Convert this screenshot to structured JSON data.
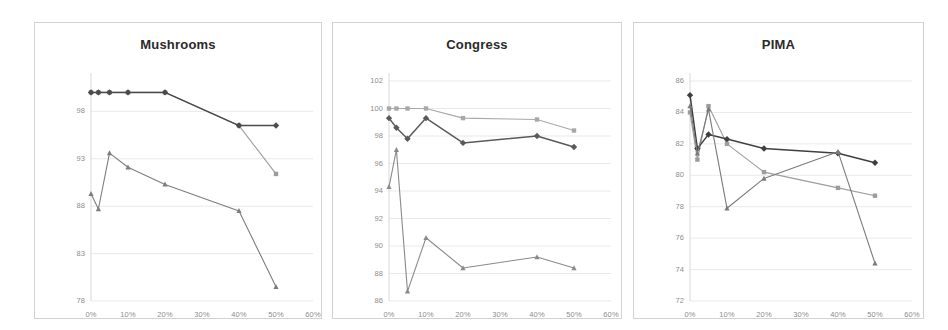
{
  "figure": {
    "background": "#ffffff",
    "panel_border_color": "#d2d2d2"
  },
  "panels": [
    {
      "id": "mushrooms",
      "title": "Mushrooms"
    },
    {
      "id": "congress",
      "title": "Congress"
    },
    {
      "id": "pima",
      "title": "PIMA"
    }
  ],
  "chart_data": [
    {
      "type": "line",
      "title": "Mushrooms",
      "xlabel": "",
      "ylabel": "",
      "xlim": [
        0,
        60
      ],
      "ylim": [
        78,
        101.2
      ],
      "yticks": [
        78,
        83,
        88,
        93,
        98
      ],
      "xticks": [
        0,
        10,
        20,
        30,
        40,
        50,
        60
      ],
      "xticklabels": [
        "0%",
        "10%",
        "20%",
        "30%",
        "40%",
        "50%",
        "60%"
      ],
      "grid": true,
      "legend": "none",
      "series": [
        {
          "name": "series-1",
          "color": "#9b9b9b",
          "marker": "square",
          "x": [
            0,
            2,
            5,
            10,
            20,
            40,
            50
          ],
          "y": [
            100.0,
            100.0,
            100.0,
            100.0,
            100.0,
            96.5,
            91.4
          ]
        },
        {
          "name": "series-2",
          "color": "#4a4a4a",
          "marker": "diamond",
          "x": [
            0,
            2,
            5,
            10,
            20,
            40,
            50
          ],
          "y": [
            100.0,
            100.0,
            100.0,
            100.0,
            100.0,
            96.5,
            96.5
          ]
        },
        {
          "name": "series-3",
          "color": "#7d7d7d",
          "marker": "triangle",
          "x": [
            0,
            2,
            5,
            10,
            20,
            40,
            50
          ],
          "y": [
            89.3,
            87.7,
            93.6,
            92.1,
            90.3,
            87.5,
            79.5
          ]
        }
      ]
    },
    {
      "type": "line",
      "title": "Congress",
      "xlabel": "",
      "ylabel": "",
      "xlim": [
        0,
        60
      ],
      "ylim": [
        86,
        102
      ],
      "yticks": [
        86,
        88,
        90,
        92,
        94,
        96,
        98,
        100,
        102
      ],
      "xticks": [
        0,
        10,
        20,
        30,
        40,
        50,
        60
      ],
      "xticklabels": [
        "0%",
        "10%",
        "20%",
        "30%",
        "40%",
        "50%",
        "60%"
      ],
      "grid": true,
      "legend": "none",
      "series": [
        {
          "name": "series-1",
          "color": "#a8a8a8",
          "marker": "square",
          "x": [
            0,
            2,
            5,
            10,
            20,
            40,
            50
          ],
          "y": [
            100.0,
            100.0,
            100.0,
            100.0,
            99.3,
            99.2,
            98.4
          ]
        },
        {
          "name": "series-2",
          "color": "#5a5a5a",
          "marker": "diamond",
          "x": [
            0,
            2,
            5,
            10,
            20,
            40,
            50
          ],
          "y": [
            99.3,
            98.6,
            97.8,
            99.3,
            97.5,
            98.0,
            97.2
          ]
        },
        {
          "name": "series-3",
          "color": "#8a8a8a",
          "marker": "triangle",
          "x": [
            0,
            2,
            5,
            10,
            20,
            40,
            50
          ],
          "y": [
            94.3,
            97.0,
            86.7,
            90.6,
            88.4,
            89.2,
            88.4
          ]
        }
      ]
    },
    {
      "type": "line",
      "title": "PIMA",
      "xlabel": "",
      "ylabel": "",
      "xlim": [
        0,
        60
      ],
      "ylim": [
        72,
        86
      ],
      "yticks": [
        72,
        74,
        76,
        78,
        80,
        82,
        84,
        86
      ],
      "xticks": [
        0,
        10,
        20,
        30,
        40,
        50,
        60
      ],
      "xticklabels": [
        "0%",
        "10%",
        "20%",
        "30%",
        "40%",
        "50%",
        "60%"
      ],
      "grid": true,
      "legend": "none",
      "series": [
        {
          "name": "series-1",
          "color": "#9d9d9d",
          "marker": "square",
          "x": [
            0,
            2,
            5,
            10,
            20,
            40,
            50
          ],
          "y": [
            84.0,
            81.0,
            84.4,
            82.0,
            80.2,
            79.2,
            78.7
          ]
        },
        {
          "name": "series-2",
          "color": "#3f3f3f",
          "marker": "diamond",
          "x": [
            0,
            2,
            5,
            10,
            20,
            40,
            50
          ],
          "y": [
            85.1,
            81.7,
            82.6,
            82.3,
            81.7,
            81.4,
            80.8
          ]
        },
        {
          "name": "series-3",
          "color": "#7a7a7a",
          "marker": "triangle",
          "x": [
            0,
            2,
            5,
            10,
            20,
            40,
            50
          ],
          "y": [
            84.4,
            81.4,
            84.2,
            77.9,
            79.8,
            81.5,
            74.4
          ]
        }
      ]
    }
  ]
}
